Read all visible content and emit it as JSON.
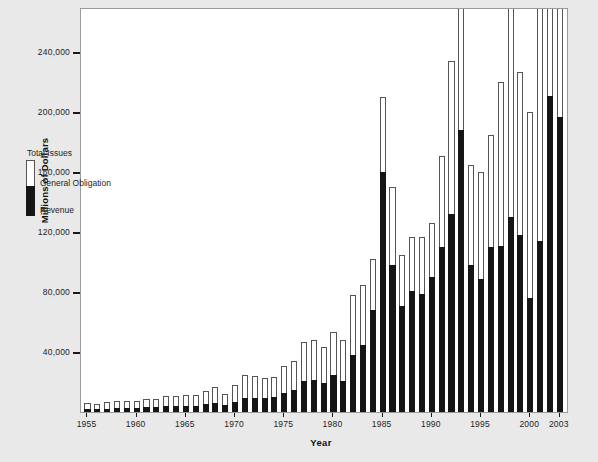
{
  "chart_data": {
    "type": "bar",
    "subtype": "stacked-vertical",
    "title": "",
    "xlabel": "Year",
    "ylabel": "Millions of Dollars",
    "ylim": [
      0,
      270000
    ],
    "ytick_values": [
      40000,
      80000,
      120000,
      160000,
      200000,
      240000
    ],
    "ytick_labels": [
      "40,000",
      "80,000",
      "120,000",
      "160,000",
      "200,000",
      "240,000"
    ],
    "xtick_labels": [
      "1955",
      "1960",
      "1965",
      "1970",
      "1975",
      "1980",
      "1985",
      "1990",
      "1995",
      "2000",
      "2003"
    ],
    "grid": false,
    "legend_position": "inside-upper-left",
    "legend": [
      {
        "key": "total",
        "label": "Total Issues",
        "color": "#ffffff"
      },
      {
        "key": "general_obligation",
        "label": "General Obligation",
        "color": "#ffffff"
      },
      {
        "key": "revenue",
        "label": "Revenue",
        "color": "#151515"
      }
    ],
    "categories": [
      "1955",
      "1956",
      "1957",
      "1958",
      "1959",
      "1960",
      "1961",
      "1962",
      "1963",
      "1964",
      "1965",
      "1966",
      "1967",
      "1968",
      "1969",
      "1970",
      "1971",
      "1972",
      "1973",
      "1974",
      "1975",
      "1976",
      "1977",
      "1978",
      "1979",
      "1980",
      "1981",
      "1982",
      "1983",
      "1984",
      "1985",
      "1986",
      "1987",
      "1988",
      "1989",
      "1990",
      "1991",
      "1992",
      "1993",
      "1994",
      "1995",
      "1996",
      "1997",
      "1998",
      "1999",
      "2000",
      "2001",
      "2002",
      "2003"
    ],
    "series": [
      {
        "name": "Total Issues",
        "values": [
          5900,
          5400,
          6900,
          7500,
          7200,
          7200,
          8400,
          8600,
          10500,
          10800,
          11100,
          11100,
          14300,
          16400,
          11700,
          18000,
          24400,
          23700,
          23000,
          23600,
          30600,
          34300,
          46700,
          48300,
          43300,
          53500,
          47700,
          78300,
          85000,
          102000,
          210000,
          150000,
          105000,
          117000,
          117000,
          126000,
          171000,
          234000,
          292000,
          165000,
          160000,
          185000,
          220000,
          286000,
          227000,
          200000,
          287000,
          357000,
          383000
        ]
      },
      {
        "name": "Revenue",
        "values": [
          2000,
          1900,
          2300,
          2600,
          2700,
          2600,
          3100,
          3200,
          3900,
          4100,
          4200,
          4300,
          5600,
          6300,
          4400,
          6900,
          9500,
          9300,
          9400,
          9800,
          12500,
          14500,
          20500,
          21500,
          19500,
          25000,
          21000,
          38000,
          45000,
          68000,
          160000,
          98000,
          71000,
          81000,
          79000,
          90000,
          110000,
          132000,
          188000,
          98000,
          89000,
          110000,
          111000,
          130000,
          118000,
          76000,
          114000,
          211000,
          197000
        ]
      }
    ],
    "note": "Stacked bars: black lower segment = Revenue, white upper remainder = General Obligation; full bar height = Total Issues."
  },
  "axis": {
    "y_title": "Millions of Dollars",
    "x_title": "Year"
  }
}
